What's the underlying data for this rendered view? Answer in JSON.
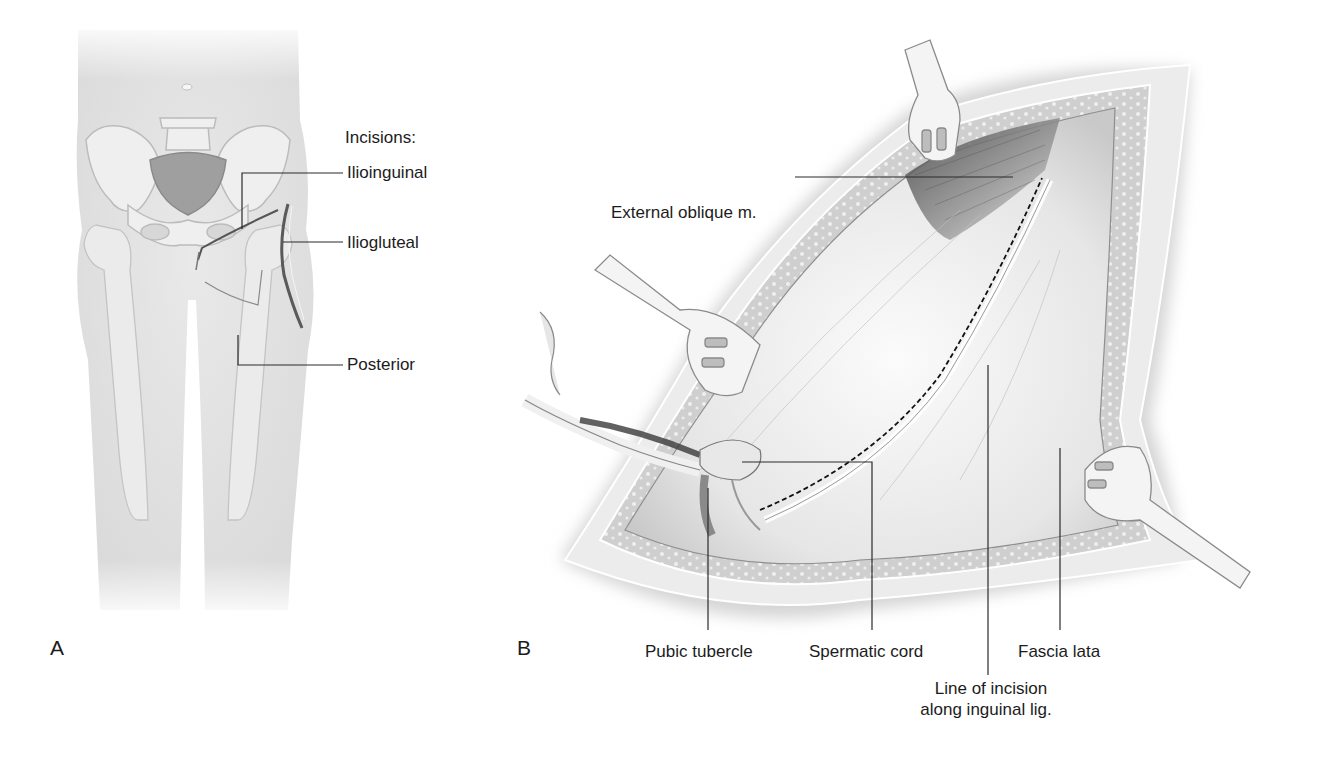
{
  "figure": {
    "panels": [
      {
        "letter": "A",
        "title": "Incisions:",
        "labels": [
          {
            "text": "Ilioinguinal"
          },
          {
            "text": "Iliogluteal"
          },
          {
            "text": "Posterior"
          }
        ]
      },
      {
        "letter": "B",
        "labels": [
          {
            "text": "External oblique m."
          },
          {
            "text": "Pubic tubercle"
          },
          {
            "text": "Spermatic cord"
          },
          {
            "text": "Fascia lata"
          },
          {
            "text": "Line of incision"
          },
          {
            "text": "along inguinal lig."
          }
        ]
      }
    ],
    "colors": {
      "skin": "#e4e4e4",
      "bone": "#efefef",
      "bone_outline": "#bdbdbd",
      "incision": "#555555",
      "leader": "#2a2a2a",
      "wound": "#f2f2f2",
      "muscle": "#6a6a6a",
      "retractor": "#f4f4f4"
    }
  }
}
